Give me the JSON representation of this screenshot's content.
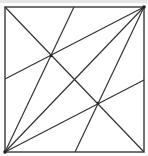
{
  "diagram": {
    "type": "geometry",
    "stroke_color": "#333333",
    "border_color": "#444444",
    "background": "#ffffff",
    "square": {
      "x": 5,
      "y": 7,
      "width": 139,
      "height": 145
    },
    "points": {
      "TL": [
        5,
        7
      ],
      "TR": [
        144,
        7
      ],
      "BL": [
        5,
        152
      ],
      "BR": [
        144,
        152
      ],
      "top_mid": [
        74,
        7
      ],
      "bottom_mid": [
        75,
        152
      ],
      "left_mid": [
        5,
        79
      ],
      "right_mid": [
        144,
        80
      ],
      "P1": [
        51,
        56
      ],
      "P2": [
        98,
        103
      ]
    },
    "segments": [
      {
        "name": "diagonal-tl-br",
        "from": "TL",
        "to": "BR"
      },
      {
        "name": "diagonal-bl-tr",
        "from": "BL",
        "to": "TR"
      },
      {
        "name": "line-bl-top-mid",
        "from": "BL",
        "to": "top_mid"
      },
      {
        "name": "line-bl-right-mid",
        "from": "BL",
        "to": "right_mid"
      },
      {
        "name": "line-tr-left-mid",
        "from": "TR",
        "to": "left_mid"
      },
      {
        "name": "line-tr-bottom-mid",
        "from": "TR",
        "to": "bottom_mid"
      }
    ],
    "vertex_dots": [
      "BL",
      "TR",
      "P1",
      "P2"
    ]
  }
}
